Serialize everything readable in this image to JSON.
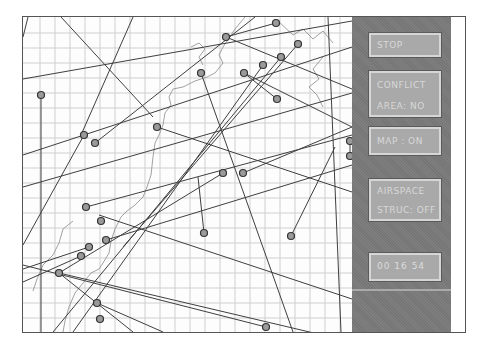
{
  "panel": {
    "buttons": {
      "stop": {
        "label": "STOP"
      },
      "conflict": {
        "line1": "CONFLICT",
        "line2": "AREA: NO"
      },
      "map": {
        "label": "MAP : ON"
      },
      "airspace": {
        "line1": "AIRSPACE",
        "line2": "STRUC: OFF"
      }
    },
    "clock": "00  16  54"
  },
  "colors": {
    "panel": "#7a7a7a",
    "button": "#a9a9a9",
    "button_text": "#d8d8d8",
    "track": "#444444",
    "grid": "#c8c8c8",
    "coastline": "#8a8a8a"
  },
  "map": {
    "grid_spacing_px": 15,
    "aircraft": [
      {
        "x": 203,
        "y": 20
      },
      {
        "x": 253,
        "y": 6
      },
      {
        "x": 275,
        "y": 27
      },
      {
        "x": 178,
        "y": 56
      },
      {
        "x": 18,
        "y": 78
      },
      {
        "x": 61,
        "y": 118
      },
      {
        "x": 72,
        "y": 126
      },
      {
        "x": 134,
        "y": 110
      },
      {
        "x": 221,
        "y": 56
      },
      {
        "x": 240,
        "y": 48
      },
      {
        "x": 258,
        "y": 40
      },
      {
        "x": 254,
        "y": 82
      },
      {
        "x": 200,
        "y": 156
      },
      {
        "x": 220,
        "y": 156
      },
      {
        "x": 63,
        "y": 190
      },
      {
        "x": 78,
        "y": 204
      },
      {
        "x": 83,
        "y": 223
      },
      {
        "x": 181,
        "y": 216
      },
      {
        "x": 76,
        "y": 198
      },
      {
        "x": 66,
        "y": 230
      },
      {
        "x": 58,
        "y": 239
      },
      {
        "x": 36,
        "y": 256
      },
      {
        "x": 74,
        "y": 286
      },
      {
        "x": 77,
        "y": 302
      },
      {
        "x": 268,
        "y": 219
      },
      {
        "x": 243,
        "y": 310
      },
      {
        "x": 325,
        "y": 99
      },
      {
        "x": 327,
        "y": 124
      },
      {
        "x": 327,
        "y": 139
      }
    ]
  }
}
